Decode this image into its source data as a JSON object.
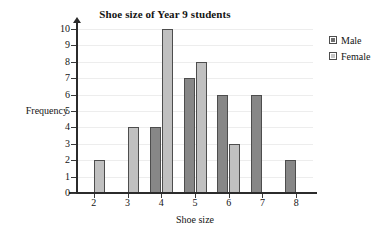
{
  "chart_data": {
    "type": "bar",
    "title": "Shoe size of Year 9 students",
    "xlabel": "Shoe size",
    "ylabel": "Frequency",
    "categories": [
      "2",
      "3",
      "4",
      "5",
      "6",
      "7",
      "8"
    ],
    "series": [
      {
        "name": "Male",
        "color": "#878787",
        "values": [
          0,
          0,
          4,
          7,
          6,
          6,
          2
        ]
      },
      {
        "name": "Female",
        "color": "#c0c0c0",
        "values": [
          2,
          4,
          10,
          8,
          3,
          0,
          0
        ]
      }
    ],
    "ylim": [
      0,
      10
    ],
    "ytick_labels": [
      "0",
      "1",
      "2",
      "3",
      "4",
      "5",
      "6",
      "7",
      "8",
      "9",
      "10"
    ],
    "grid": true,
    "legend_position": "top-right",
    "legend_entries": [
      {
        "label": "Male",
        "swatch": "dark-gray-square-icon"
      },
      {
        "label": "Female",
        "swatch": "light-gray-square-icon"
      }
    ]
  }
}
